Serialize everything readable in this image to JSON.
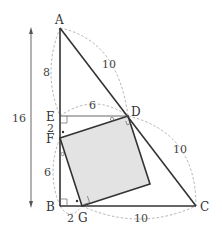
{
  "diagram": {
    "title": "",
    "points": {
      "A": "A",
      "B": "B",
      "C": "C",
      "D": "D",
      "E": "E",
      "F": "F",
      "G": "G"
    },
    "lengths": {
      "total_height": "16",
      "AE": "8",
      "AD": "10",
      "ED": "6",
      "DC": "10",
      "EF": "2",
      "FB": "6",
      "BG": "2",
      "GC": "10"
    },
    "shaded_square": "FGHD (shaded square)",
    "right_angle_marks": [
      "E",
      "B",
      "G",
      "D"
    ],
    "angle_marks": {
      "dot": [
        "F",
        "G"
      ],
      "circle": [
        "F",
        "D"
      ]
    },
    "colors": {
      "edge": "#333333",
      "fill": "#e3e3e3",
      "arc": "#aaaaaa"
    }
  }
}
